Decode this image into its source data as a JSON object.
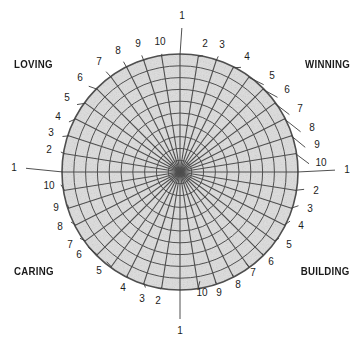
{
  "diagram": {
    "quadrant_labels": [
      {
        "id": "loving",
        "text": "LOVING"
      },
      {
        "id": "winning",
        "text": "WINNING"
      },
      {
        "id": "caring",
        "text": "CARING"
      },
      {
        "id": "building",
        "text": "BUILDING"
      }
    ],
    "colors": {
      "fill": "#d9d9d9",
      "grid": "#4f4f4f",
      "text": "#1a1a1a",
      "background": "#ffffff"
    },
    "geometry": {
      "center_x": 180,
      "center_y": 172,
      "radius": 118,
      "spoke_count": 40,
      "ring_count": 10
    },
    "axis_labels": [
      {
        "n": "1",
        "x": 182,
        "y": 16
      },
      {
        "n": "2",
        "x": 205,
        "y": 44
      },
      {
        "n": "3",
        "x": 222,
        "y": 45
      },
      {
        "n": "4",
        "x": 247,
        "y": 57
      },
      {
        "n": "5",
        "x": 272,
        "y": 76
      },
      {
        "n": "6",
        "x": 287,
        "y": 90
      },
      {
        "n": "7",
        "x": 300,
        "y": 109
      },
      {
        "n": "8",
        "x": 312,
        "y": 128
      },
      {
        "n": "9",
        "x": 317,
        "y": 145
      },
      {
        "n": "10",
        "x": 321,
        "y": 163
      },
      {
        "n": "1",
        "x": 347,
        "y": 170
      },
      {
        "n": "2",
        "x": 316,
        "y": 191
      },
      {
        "n": "3",
        "x": 310,
        "y": 209
      },
      {
        "n": "4",
        "x": 301,
        "y": 226
      },
      {
        "n": "5",
        "x": 289,
        "y": 245
      },
      {
        "n": "6",
        "x": 271,
        "y": 262
      },
      {
        "n": "7",
        "x": 253,
        "y": 273
      },
      {
        "n": "8",
        "x": 238,
        "y": 285
      },
      {
        "n": "9",
        "x": 219,
        "y": 293
      },
      {
        "n": "10",
        "x": 202,
        "y": 293
      },
      {
        "n": "1",
        "x": 180,
        "y": 331
      },
      {
        "n": "2",
        "x": 158,
        "y": 301
      },
      {
        "n": "3",
        "x": 142,
        "y": 299
      },
      {
        "n": "4",
        "x": 123,
        "y": 288
      },
      {
        "n": "5",
        "x": 99,
        "y": 271
      },
      {
        "n": "6",
        "x": 79,
        "y": 255
      },
      {
        "n": "7",
        "x": 70,
        "y": 245
      },
      {
        "n": "8",
        "x": 60,
        "y": 227
      },
      {
        "n": "9",
        "x": 56,
        "y": 208
      },
      {
        "n": "10",
        "x": 49,
        "y": 186
      },
      {
        "n": "1",
        "x": 14,
        "y": 168
      },
      {
        "n": "2",
        "x": 49,
        "y": 150
      },
      {
        "n": "3",
        "x": 51,
        "y": 133
      },
      {
        "n": "4",
        "x": 58,
        "y": 117
      },
      {
        "n": "5",
        "x": 67,
        "y": 98
      },
      {
        "n": "6",
        "x": 80,
        "y": 78
      },
      {
        "n": "7",
        "x": 99,
        "y": 62
      },
      {
        "n": "8",
        "x": 118,
        "y": 51
      },
      {
        "n": "9",
        "x": 138,
        "y": 44
      },
      {
        "n": "10",
        "x": 160,
        "y": 42
      }
    ]
  }
}
